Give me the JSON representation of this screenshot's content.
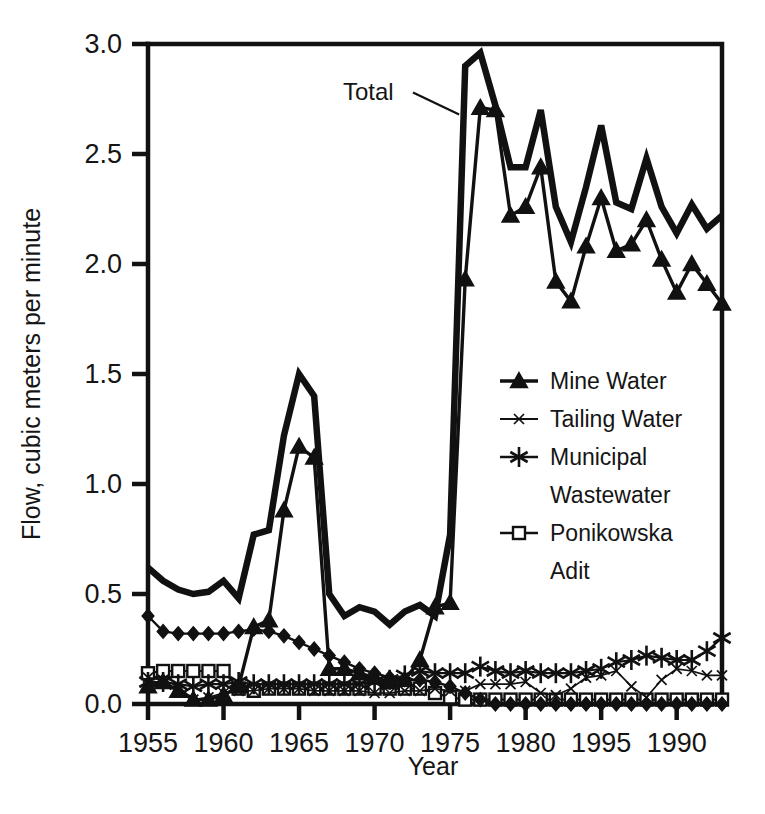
{
  "chart_data": {
    "type": "line",
    "title": "",
    "xlabel": "Year",
    "ylabel": "Flow, cubic meters per minute",
    "xlim": [
      1955,
      1993
    ],
    "ylim": [
      0.0,
      3.0
    ],
    "grid": false,
    "legend_position": "center-right",
    "x_tick_labels": [
      "1955",
      "1960",
      "1965",
      "1970",
      "1975",
      "1980",
      "1995",
      "1990"
    ],
    "x_tick_values": [
      1955,
      1960,
      1965,
      1970,
      1975,
      1980,
      1985,
      1990
    ],
    "y_tick_labels": [
      "0.0",
      "0.5",
      "1.0",
      "1.5",
      "2.0",
      "2.5",
      "3.0"
    ],
    "y_tick_values": [
      0.0,
      0.5,
      1.0,
      1.5,
      2.0,
      2.5,
      3.0
    ],
    "annotations": [
      {
        "text": "Total",
        "x": 1974.0,
        "y": 2.78,
        "points_to_x": 1975.6,
        "points_to_y": 2.68
      }
    ],
    "x": [
      1955,
      1956,
      1957,
      1958,
      1959,
      1960,
      1961,
      1962,
      1963,
      1964,
      1965,
      1966,
      1967,
      1968,
      1969,
      1970,
      1971,
      1972,
      1973,
      1974,
      1975,
      1976,
      1977,
      1978,
      1979,
      1980,
      1981,
      1982,
      1983,
      1984,
      1985,
      1986,
      1987,
      1988,
      1989,
      1990,
      1991,
      1992,
      1993
    ],
    "series": [
      {
        "name": "Total",
        "marker": "none",
        "line": "thick",
        "values": [
          0.62,
          0.56,
          0.52,
          0.5,
          0.51,
          0.56,
          0.48,
          0.77,
          0.79,
          1.22,
          1.5,
          1.4,
          0.5,
          0.4,
          0.44,
          0.42,
          0.36,
          0.42,
          0.45,
          0.4,
          0.77,
          2.9,
          2.96,
          2.72,
          2.44,
          2.44,
          2.7,
          2.26,
          2.1,
          2.35,
          2.63,
          2.28,
          2.25,
          2.48,
          2.26,
          2.14,
          2.27,
          2.16,
          2.22
        ]
      },
      {
        "name": "Mine Water",
        "marker": "triangle",
        "line": "medium",
        "values": [
          0.08,
          0.1,
          0.06,
          0.02,
          0.02,
          0.04,
          0.08,
          0.35,
          0.38,
          0.88,
          1.17,
          1.12,
          0.16,
          0.16,
          0.14,
          0.12,
          0.1,
          0.11,
          0.2,
          0.44,
          0.46,
          1.93,
          2.71,
          2.7,
          2.22,
          2.26,
          2.44,
          1.92,
          1.83,
          2.08,
          2.3,
          2.06,
          2.09,
          2.2,
          2.02,
          1.87,
          2.0,
          1.91,
          1.82
        ]
      },
      {
        "name": "Tailing Water",
        "marker": "x-small",
        "line": "thin",
        "values": [
          0.12,
          0.11,
          0.08,
          0.02,
          0.03,
          0.05,
          0.06,
          0.06,
          0.07,
          0.07,
          0.07,
          0.06,
          0.06,
          0.06,
          0.06,
          0.05,
          0.05,
          0.06,
          0.06,
          0.07,
          0.06,
          0.06,
          0.09,
          0.09,
          0.09,
          0.1,
          0.05,
          0.04,
          0.07,
          0.12,
          0.13,
          0.15,
          0.08,
          0.03,
          0.11,
          0.16,
          0.15,
          0.13,
          0.13
        ]
      },
      {
        "name": "Municipal Wastewater",
        "marker": "star",
        "line": "medium",
        "values": [
          0.1,
          0.1,
          0.09,
          0.08,
          0.09,
          0.09,
          0.1,
          0.09,
          0.09,
          0.09,
          0.09,
          0.09,
          0.09,
          0.09,
          0.09,
          0.1,
          0.11,
          0.13,
          0.15,
          0.14,
          0.14,
          0.14,
          0.17,
          0.15,
          0.14,
          0.15,
          0.14,
          0.14,
          0.14,
          0.15,
          0.16,
          0.19,
          0.2,
          0.22,
          0.21,
          0.2,
          0.2,
          0.24,
          0.3
        ]
      },
      {
        "name": "Ponikowska Adit",
        "marker": "square",
        "line": "medium",
        "values": [
          0.14,
          0.15,
          0.15,
          0.15,
          0.15,
          0.15,
          0.07,
          0.06,
          0.07,
          0.07,
          0.07,
          0.07,
          0.07,
          0.07,
          0.07,
          0.07,
          0.07,
          0.07,
          0.07,
          0.05,
          0.03,
          0.02,
          0.02,
          0.02,
          0.02,
          0.02,
          0.02,
          0.02,
          0.02,
          0.02,
          0.02,
          0.02,
          0.02,
          0.02,
          0.02,
          0.02,
          0.02,
          0.02,
          0.02
        ]
      },
      {
        "name": "Other Inflow",
        "marker": "diamond",
        "line": "medium",
        "values": [
          0.4,
          0.33,
          0.32,
          0.32,
          0.32,
          0.32,
          0.33,
          0.34,
          0.33,
          0.31,
          0.28,
          0.25,
          0.22,
          0.19,
          0.16,
          0.14,
          0.12,
          0.11,
          0.11,
          0.1,
          0.08,
          0.05,
          0.02,
          0.0,
          0.0,
          0.0,
          0.0,
          0.0,
          0.0,
          0.0,
          0.0,
          0.0,
          0.0,
          0.0,
          0.0,
          0.0,
          0.0,
          0.0,
          0.0
        ]
      }
    ],
    "legend_entries": [
      {
        "label": "Mine Water",
        "marker": "triangle"
      },
      {
        "label": "Tailing Water",
        "marker": "x-small"
      },
      {
        "label": "Municipal",
        "label2": "Wastewater",
        "marker": "star"
      },
      {
        "label": "Ponikowska",
        "label2": "Adit",
        "marker": "square"
      }
    ]
  },
  "axis": {
    "x_title": "Year",
    "y_title": "Flow, cubic meters per minute"
  },
  "colors": {
    "ink": "#111111",
    "background": "#ffffff"
  }
}
